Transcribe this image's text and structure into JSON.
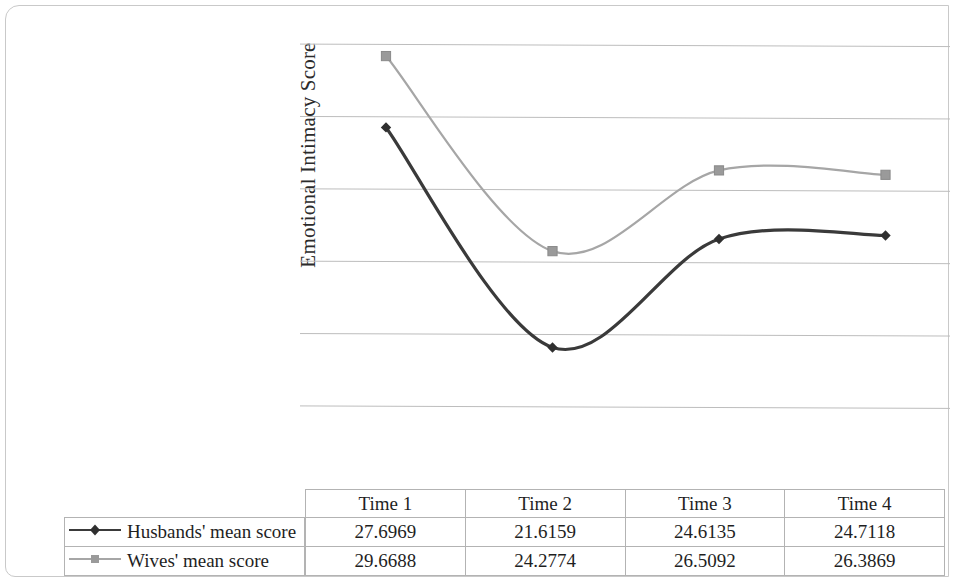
{
  "chart_data": {
    "type": "line",
    "title": "",
    "xlabel": "",
    "ylabel": "Emotional Intimacy Score",
    "categories": [
      "Time 1",
      "Time 2",
      "Time 3",
      "Time 4"
    ],
    "series": [
      {
        "name": "Husbands' mean score",
        "values": [
          27.6969,
          21.6159,
          24.6135,
          24.7118
        ],
        "color": "#3a3a3a",
        "marker": "diamond"
      },
      {
        "name": "Wives' mean score",
        "values": [
          29.6688,
          24.2774,
          26.5092,
          26.3869
        ],
        "color": "#a6a6a6",
        "marker": "square"
      }
    ],
    "ylim": [
      19.5,
      30.5
    ],
    "gridlines": [
      20,
      22,
      24,
      26,
      28,
      30
    ],
    "grid": true,
    "y_tick_labels_visible": false,
    "legend_position": "bottom-left-table",
    "smoothing": "spline"
  },
  "table": {
    "column_headers": [
      "Time 1",
      "Time 2",
      "Time 3",
      "Time 4"
    ],
    "rows": [
      {
        "legend_label": "Husbands' mean score",
        "values": [
          "27.6969",
          "21.6159",
          "24.6135",
          "24.7118"
        ]
      },
      {
        "legend_label": "Wives' mean score",
        "values": [
          "29.6688",
          "24.2774",
          "26.5092",
          "26.3869"
        ]
      }
    ]
  },
  "axis": {
    "y_title": "Emotional Intimacy Score"
  },
  "colors": {
    "husbands_line": "#3a3a3a",
    "wives_line": "#a6a6a6",
    "gridline": "#bdbdbd",
    "table_border": "#b3b3b3",
    "page_border": "#c9c9c9"
  }
}
